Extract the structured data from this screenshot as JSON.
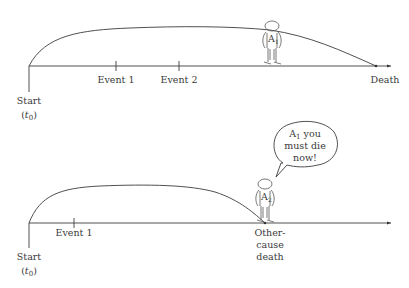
{
  "panels": [
    {
      "id": "top",
      "start_label": "Start",
      "start_sub": "t",
      "start_sub_index": "0",
      "events": [
        "Event 1",
        "Event 2"
      ],
      "end_label": "Death",
      "figure_label": "A",
      "figure_index": "1"
    },
    {
      "id": "bottom",
      "start_label": "Start",
      "start_sub": "t",
      "start_sub_index": "0",
      "events": [
        "Event 1"
      ],
      "end_label_lines": [
        "Other-",
        "cause",
        "death"
      ],
      "figure_label": "A",
      "figure_index": "2",
      "speech": {
        "line1_main": "A",
        "line1_index": "1",
        "line1_rest": " you",
        "line2": "must die",
        "line3": "now!"
      }
    }
  ]
}
